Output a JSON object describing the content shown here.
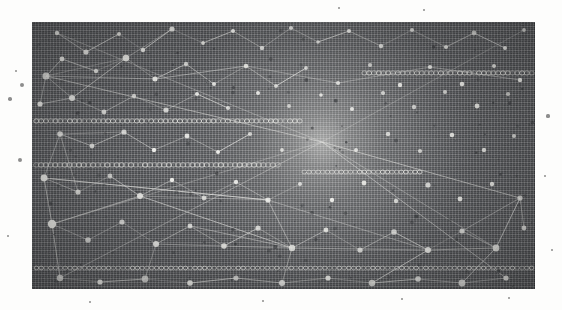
{
  "meta": {
    "canvas": {
      "width": 562,
      "height": 310
    },
    "background_color": "#fdfdfc"
  },
  "panel": {
    "name": "network-visualization-panel",
    "x": 32,
    "y": 22,
    "width": 503,
    "height": 267,
    "base_color": "#54565a",
    "edge_color": "#3a3c40",
    "description": "Dark rectangular plate filled with dense vertical and horizontal ruling lines, overlaid by a white node-and-edge network graph and a bright radial vanishing-point glow near the center."
  },
  "glow": {
    "name": "vanishing-point-glow",
    "center_x": 322,
    "center_y": 142,
    "radius": 150,
    "color": "#cfd0cb",
    "intensity": 0.55
  },
  "striping": {
    "vertical_spacing_px": 3,
    "horizontal_spacing_px": 4,
    "line_color_light": "#d8d8d4",
    "line_color_dark": "#3d3f43"
  },
  "glyph_rows": [
    {
      "label": "circle-row-upper-right",
      "x": 362,
      "y": 73,
      "width": 172,
      "count": 36,
      "r": 2.6
    },
    {
      "label": "circle-row-upper-left",
      "x": 34,
      "y": 121,
      "width": 268,
      "count": 56,
      "r": 2.6
    },
    {
      "label": "circle-row-mid-left",
      "x": 34,
      "y": 165,
      "width": 246,
      "count": 52,
      "r": 2.8
    },
    {
      "label": "circle-row-mid-right",
      "x": 302,
      "y": 172,
      "width": 120,
      "count": 26,
      "r": 2.4
    },
    {
      "label": "circle-row-lower",
      "x": 34,
      "y": 268,
      "width": 500,
      "count": 104,
      "r": 2.3
    }
  ],
  "nodes": [
    {
      "x": 57,
      "y": 33,
      "r": 2.2
    },
    {
      "x": 86,
      "y": 52,
      "r": 2.6
    },
    {
      "x": 119,
      "y": 34,
      "r": 2.0
    },
    {
      "x": 143,
      "y": 50,
      "r": 2.2
    },
    {
      "x": 172,
      "y": 29,
      "r": 2.6
    },
    {
      "x": 203,
      "y": 43,
      "r": 1.9
    },
    {
      "x": 233,
      "y": 31,
      "r": 2.0
    },
    {
      "x": 262,
      "y": 48,
      "r": 2.2
    },
    {
      "x": 291,
      "y": 28,
      "r": 2.1
    },
    {
      "x": 318,
      "y": 42,
      "r": 1.8
    },
    {
      "x": 349,
      "y": 31,
      "r": 2.0
    },
    {
      "x": 381,
      "y": 46,
      "r": 2.2
    },
    {
      "x": 412,
      "y": 30,
      "r": 2.0
    },
    {
      "x": 446,
      "y": 47,
      "r": 2.1
    },
    {
      "x": 474,
      "y": 33,
      "r": 2.4
    },
    {
      "x": 505,
      "y": 48,
      "r": 2.0
    },
    {
      "x": 524,
      "y": 30,
      "r": 1.9
    },
    {
      "x": 46,
      "y": 76,
      "r": 3.6
    },
    {
      "x": 62,
      "y": 59,
      "r": 2.4
    },
    {
      "x": 96,
      "y": 71,
      "r": 2.2
    },
    {
      "x": 126,
      "y": 58,
      "r": 3.3
    },
    {
      "x": 155,
      "y": 79,
      "r": 2.5
    },
    {
      "x": 186,
      "y": 64,
      "r": 2.2
    },
    {
      "x": 214,
      "y": 84,
      "r": 2.0
    },
    {
      "x": 246,
      "y": 66,
      "r": 2.3
    },
    {
      "x": 276,
      "y": 86,
      "r": 2.0
    },
    {
      "x": 306,
      "y": 68,
      "r": 1.9
    },
    {
      "x": 338,
      "y": 83,
      "r": 2.1
    },
    {
      "x": 370,
      "y": 65,
      "r": 2.0
    },
    {
      "x": 400,
      "y": 85,
      "r": 2.2
    },
    {
      "x": 430,
      "y": 67,
      "r": 2.1
    },
    {
      "x": 462,
      "y": 84,
      "r": 2.3
    },
    {
      "x": 494,
      "y": 66,
      "r": 2.0
    },
    {
      "x": 520,
      "y": 80,
      "r": 2.2
    },
    {
      "x": 40,
      "y": 104,
      "r": 2.6
    },
    {
      "x": 72,
      "y": 98,
      "r": 3.0
    },
    {
      "x": 104,
      "y": 112,
      "r": 2.4
    },
    {
      "x": 134,
      "y": 96,
      "r": 2.2
    },
    {
      "x": 166,
      "y": 110,
      "r": 2.6
    },
    {
      "x": 197,
      "y": 94,
      "r": 2.0
    },
    {
      "x": 228,
      "y": 108,
      "r": 2.1
    },
    {
      "x": 258,
      "y": 93,
      "r": 2.0
    },
    {
      "x": 289,
      "y": 106,
      "r": 1.9
    },
    {
      "x": 321,
      "y": 95,
      "r": 1.8
    },
    {
      "x": 352,
      "y": 109,
      "r": 2.0
    },
    {
      "x": 383,
      "y": 93,
      "r": 2.1
    },
    {
      "x": 414,
      "y": 107,
      "r": 2.2
    },
    {
      "x": 445,
      "y": 92,
      "r": 2.0
    },
    {
      "x": 477,
      "y": 106,
      "r": 2.4
    },
    {
      "x": 508,
      "y": 94,
      "r": 2.1
    },
    {
      "x": 60,
      "y": 134,
      "r": 2.8
    },
    {
      "x": 92,
      "y": 146,
      "r": 2.4
    },
    {
      "x": 124,
      "y": 132,
      "r": 2.6
    },
    {
      "x": 154,
      "y": 150,
      "r": 2.2
    },
    {
      "x": 187,
      "y": 136,
      "r": 2.4
    },
    {
      "x": 218,
      "y": 152,
      "r": 2.0
    },
    {
      "x": 250,
      "y": 134,
      "r": 2.1
    },
    {
      "x": 282,
      "y": 150,
      "r": 1.9
    },
    {
      "x": 356,
      "y": 150,
      "r": 2.0
    },
    {
      "x": 388,
      "y": 134,
      "r": 2.2
    },
    {
      "x": 420,
      "y": 151,
      "r": 2.1
    },
    {
      "x": 452,
      "y": 135,
      "r": 2.3
    },
    {
      "x": 484,
      "y": 150,
      "r": 2.2
    },
    {
      "x": 514,
      "y": 136,
      "r": 2.0
    },
    {
      "x": 44,
      "y": 178,
      "r": 3.4
    },
    {
      "x": 78,
      "y": 192,
      "r": 2.6
    },
    {
      "x": 110,
      "y": 176,
      "r": 2.4
    },
    {
      "x": 140,
      "y": 196,
      "r": 3.0
    },
    {
      "x": 172,
      "y": 180,
      "r": 2.2
    },
    {
      "x": 204,
      "y": 198,
      "r": 2.4
    },
    {
      "x": 236,
      "y": 182,
      "r": 2.2
    },
    {
      "x": 268,
      "y": 200,
      "r": 2.6
    },
    {
      "x": 300,
      "y": 184,
      "r": 2.0
    },
    {
      "x": 332,
      "y": 200,
      "r": 2.2
    },
    {
      "x": 364,
      "y": 183,
      "r": 2.4
    },
    {
      "x": 396,
      "y": 201,
      "r": 2.2
    },
    {
      "x": 428,
      "y": 185,
      "r": 2.6
    },
    {
      "x": 460,
      "y": 199,
      "r": 2.4
    },
    {
      "x": 492,
      "y": 184,
      "r": 2.2
    },
    {
      "x": 520,
      "y": 198,
      "r": 2.6
    },
    {
      "x": 52,
      "y": 224,
      "r": 4.2
    },
    {
      "x": 88,
      "y": 240,
      "r": 2.8
    },
    {
      "x": 122,
      "y": 222,
      "r": 2.6
    },
    {
      "x": 156,
      "y": 244,
      "r": 3.0
    },
    {
      "x": 190,
      "y": 226,
      "r": 2.4
    },
    {
      "x": 224,
      "y": 246,
      "r": 2.8
    },
    {
      "x": 258,
      "y": 228,
      "r": 2.6
    },
    {
      "x": 292,
      "y": 248,
      "r": 3.2
    },
    {
      "x": 326,
      "y": 230,
      "r": 2.4
    },
    {
      "x": 360,
      "y": 250,
      "r": 2.6
    },
    {
      "x": 394,
      "y": 232,
      "r": 2.8
    },
    {
      "x": 428,
      "y": 250,
      "r": 3.0
    },
    {
      "x": 462,
      "y": 231,
      "r": 2.6
    },
    {
      "x": 496,
      "y": 248,
      "r": 3.4
    },
    {
      "x": 524,
      "y": 228,
      "r": 2.4
    },
    {
      "x": 60,
      "y": 278,
      "r": 3.2
    },
    {
      "x": 100,
      "y": 282,
      "r": 2.6
    },
    {
      "x": 145,
      "y": 279,
      "r": 3.4
    },
    {
      "x": 190,
      "y": 283,
      "r": 2.8
    },
    {
      "x": 236,
      "y": 278,
      "r": 2.6
    },
    {
      "x": 282,
      "y": 283,
      "r": 3.0
    },
    {
      "x": 328,
      "y": 278,
      "r": 2.6
    },
    {
      "x": 372,
      "y": 283,
      "r": 3.2
    },
    {
      "x": 418,
      "y": 279,
      "r": 2.8
    },
    {
      "x": 462,
      "y": 283,
      "r": 3.4
    },
    {
      "x": 506,
      "y": 278,
      "r": 2.6
    }
  ],
  "edges": [
    [
      57,
      33,
      86,
      52
    ],
    [
      86,
      52,
      119,
      34
    ],
    [
      119,
      34,
      143,
      50
    ],
    [
      143,
      50,
      172,
      29
    ],
    [
      172,
      29,
      203,
      43
    ],
    [
      203,
      43,
      233,
      31
    ],
    [
      233,
      31,
      262,
      48
    ],
    [
      262,
      48,
      291,
      28
    ],
    [
      291,
      28,
      318,
      42
    ],
    [
      318,
      42,
      349,
      31
    ],
    [
      349,
      31,
      381,
      46
    ],
    [
      381,
      46,
      412,
      30
    ],
    [
      412,
      30,
      446,
      47
    ],
    [
      446,
      47,
      474,
      33
    ],
    [
      474,
      33,
      505,
      48
    ],
    [
      46,
      76,
      62,
      59
    ],
    [
      62,
      59,
      96,
      71
    ],
    [
      96,
      71,
      126,
      58
    ],
    [
      126,
      58,
      155,
      79
    ],
    [
      155,
      79,
      186,
      64
    ],
    [
      186,
      64,
      214,
      84
    ],
    [
      214,
      84,
      246,
      66
    ],
    [
      246,
      66,
      276,
      86
    ],
    [
      276,
      86,
      306,
      68
    ],
    [
      46,
      76,
      40,
      104
    ],
    [
      40,
      104,
      72,
      98
    ],
    [
      72,
      98,
      104,
      112
    ],
    [
      104,
      112,
      134,
      96
    ],
    [
      134,
      96,
      166,
      110
    ],
    [
      166,
      110,
      197,
      94
    ],
    [
      197,
      94,
      228,
      108
    ],
    [
      60,
      134,
      92,
      146
    ],
    [
      92,
      146,
      124,
      132
    ],
    [
      124,
      132,
      154,
      150
    ],
    [
      154,
      150,
      187,
      136
    ],
    [
      187,
      136,
      218,
      152
    ],
    [
      218,
      152,
      250,
      134
    ],
    [
      44,
      178,
      78,
      192
    ],
    [
      78,
      192,
      110,
      176
    ],
    [
      110,
      176,
      140,
      196
    ],
    [
      140,
      196,
      172,
      180
    ],
    [
      172,
      180,
      204,
      198
    ],
    [
      204,
      198,
      236,
      182
    ],
    [
      236,
      182,
      268,
      200
    ],
    [
      268,
      200,
      300,
      184
    ],
    [
      52,
      224,
      88,
      240
    ],
    [
      88,
      240,
      122,
      222
    ],
    [
      122,
      222,
      156,
      244
    ],
    [
      156,
      244,
      190,
      226
    ],
    [
      190,
      226,
      224,
      246
    ],
    [
      224,
      246,
      258,
      228
    ],
    [
      258,
      228,
      292,
      248
    ],
    [
      292,
      248,
      326,
      230
    ],
    [
      326,
      230,
      360,
      250
    ],
    [
      360,
      250,
      394,
      232
    ],
    [
      394,
      232,
      428,
      250
    ],
    [
      428,
      250,
      462,
      231
    ],
    [
      462,
      231,
      496,
      248
    ],
    [
      60,
      278,
      100,
      282
    ],
    [
      100,
      282,
      145,
      279
    ],
    [
      145,
      279,
      190,
      283
    ],
    [
      190,
      283,
      236,
      278
    ],
    [
      236,
      278,
      282,
      283
    ],
    [
      282,
      283,
      328,
      278
    ],
    [
      328,
      278,
      372,
      283
    ],
    [
      372,
      283,
      418,
      279
    ],
    [
      418,
      279,
      462,
      283
    ],
    [
      462,
      283,
      506,
      278
    ],
    [
      46,
      76,
      126,
      58
    ],
    [
      126,
      58,
      172,
      29
    ],
    [
      46,
      76,
      72,
      98
    ],
    [
      72,
      98,
      126,
      58
    ],
    [
      60,
      134,
      44,
      178
    ],
    [
      44,
      178,
      52,
      224
    ],
    [
      52,
      224,
      140,
      196
    ],
    [
      140,
      196,
      268,
      200
    ],
    [
      268,
      200,
      292,
      248
    ],
    [
      292,
      248,
      428,
      250
    ],
    [
      428,
      250,
      496,
      248
    ],
    [
      140,
      196,
      52,
      224
    ],
    [
      78,
      192,
      60,
      134
    ],
    [
      60,
      134,
      124,
      132
    ],
    [
      268,
      200,
      44,
      178
    ],
    [
      292,
      248,
      156,
      244
    ],
    [
      292,
      248,
      190,
      226
    ],
    [
      428,
      250,
      394,
      232
    ],
    [
      496,
      248,
      520,
      198
    ],
    [
      520,
      198,
      524,
      228
    ],
    [
      44,
      178,
      268,
      200
    ],
    [
      268,
      200,
      428,
      250
    ],
    [
      140,
      196,
      292,
      248
    ],
    [
      46,
      76,
      155,
      79
    ],
    [
      155,
      79,
      246,
      66
    ],
    [
      246,
      66,
      338,
      83
    ],
    [
      338,
      83,
      430,
      67
    ],
    [
      430,
      67,
      520,
      80
    ],
    [
      496,
      248,
      462,
      283
    ],
    [
      428,
      250,
      372,
      283
    ],
    [
      292,
      248,
      282,
      283
    ],
    [
      156,
      244,
      145,
      279
    ],
    [
      52,
      224,
      60,
      278
    ],
    [
      520,
      198,
      496,
      248
    ],
    [
      462,
      231,
      520,
      198
    ],
    [
      322,
      142,
      46,
      76
    ],
    [
      322,
      142,
      52,
      224
    ],
    [
      322,
      142,
      524,
      30
    ],
    [
      322,
      142,
      520,
      198
    ],
    [
      322,
      142,
      60,
      278
    ],
    [
      322,
      142,
      506,
      278
    ],
    [
      322,
      142,
      57,
      33
    ],
    [
      322,
      142,
      496,
      248
    ]
  ],
  "outer_specks": [
    {
      "x": 22,
      "y": 85,
      "r": 2.0
    },
    {
      "x": 10,
      "y": 99,
      "r": 1.8
    },
    {
      "x": 20,
      "y": 160,
      "r": 2.0
    },
    {
      "x": 16,
      "y": 71,
      "r": 1.4
    },
    {
      "x": 339,
      "y": 8,
      "r": 1.3
    },
    {
      "x": 424,
      "y": 10,
      "r": 1.1
    },
    {
      "x": 548,
      "y": 116,
      "r": 1.6
    },
    {
      "x": 545,
      "y": 176,
      "r": 1.3
    },
    {
      "x": 552,
      "y": 250,
      "r": 1.2
    },
    {
      "x": 263,
      "y": 301,
      "r": 1.3
    },
    {
      "x": 402,
      "y": 299,
      "r": 1.2
    },
    {
      "x": 90,
      "y": 302,
      "r": 1.2
    },
    {
      "x": 509,
      "y": 298,
      "r": 1.1
    },
    {
      "x": 8,
      "y": 236,
      "r": 1.1
    }
  ]
}
